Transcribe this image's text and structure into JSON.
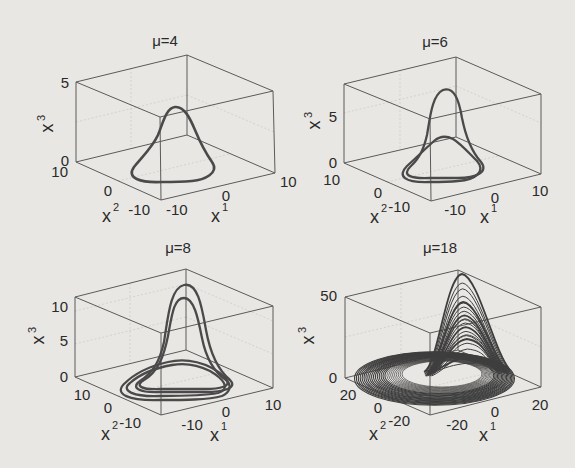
{
  "figure": {
    "background": "#e9e7e3",
    "line_color": "#4a4a4a",
    "box_color": "#5a5a5a"
  },
  "chart_data": [
    {
      "type": "line",
      "subtype": "3d-trajectory",
      "title": "μ=4",
      "xlabel": "x",
      "xlabel_sup": "1",
      "ylabel": "x",
      "ylabel_sup": "2",
      "zlabel": "x",
      "zlabel_sup": "3",
      "x_ticks": [
        "-10",
        "0",
        "10"
      ],
      "y_ticks": [
        "-10",
        "0",
        "10"
      ],
      "z_ticks": [
        "0",
        "5"
      ],
      "xlim": [
        -10,
        10
      ],
      "ylim": [
        -10,
        10
      ],
      "zlim": [
        0,
        5
      ],
      "description": "Single closed limit cycle; loop near x3≈0 rising to a peak of about x3≈3.5",
      "loops": 1,
      "peak_z": [
        3.5
      ]
    },
    {
      "type": "line",
      "subtype": "3d-trajectory",
      "title": "μ=6",
      "xlabel": "x",
      "xlabel_sup": "1",
      "ylabel": "x",
      "ylabel_sup": "2",
      "zlabel": "x",
      "zlabel_sup": "3",
      "x_ticks": [
        "-10",
        "0",
        "10"
      ],
      "y_ticks": [
        "-10",
        "0",
        "10"
      ],
      "z_ticks": [
        "0",
        "5"
      ],
      "xlim": [
        -10,
        10
      ],
      "ylim": [
        -10,
        10
      ],
      "zlim": [
        0,
        8
      ],
      "description": "Period-2 cycle: two loops, peaks at about x3≈7 and x3≈2.5",
      "loops": 2,
      "peak_z": [
        7,
        2.5
      ]
    },
    {
      "type": "line",
      "subtype": "3d-trajectory",
      "title": "μ=8",
      "xlabel": "x",
      "xlabel_sup": "1",
      "ylabel": "x",
      "ylabel_sup": "2",
      "zlabel": "x",
      "zlabel_sup": "3",
      "x_ticks": [
        "-10",
        "0",
        "10"
      ],
      "y_ticks": [
        "-10",
        "0",
        "10"
      ],
      "z_ticks": [
        "0",
        "5",
        "10"
      ],
      "xlim": [
        -12,
        12
      ],
      "ylim": [
        -12,
        12
      ],
      "zlim": [
        0,
        12
      ],
      "description": "Period-4 cycle: four loops, two tall peaks near x3≈13 and x3≈11, two low loops near x3≈2",
      "loops": 4,
      "peak_z": [
        13.5,
        11.5,
        2.2,
        1.5
      ]
    },
    {
      "type": "line",
      "subtype": "3d-trajectory",
      "title": "μ=18",
      "xlabel": "x",
      "xlabel_sup": "1",
      "ylabel": "x",
      "ylabel_sup": "2",
      "zlabel": "x",
      "zlabel_sup": "3",
      "x_ticks": [
        "-20",
        "0",
        "20"
      ],
      "y_ticks": [
        "-20",
        "0",
        "20"
      ],
      "z_ticks": [
        "0",
        "50"
      ],
      "xlim": [
        -25,
        25
      ],
      "ylim": [
        -25,
        25
      ],
      "zlim": [
        0,
        50
      ],
      "description": "Chaotic (Rössler-type) attractor: dense spiral band in x1-x2 plane with excursions up to x3≈60",
      "loops": 22,
      "peak_z": [
        60,
        55,
        52,
        48,
        45,
        42,
        40,
        38,
        36,
        34,
        32,
        30,
        28,
        26,
        24,
        22,
        20,
        18,
        15,
        12,
        8,
        5
      ]
    }
  ],
  "panels": [
    {
      "title": "μ=4",
      "x_ticks": [
        "-10",
        "0",
        "10"
      ],
      "y_ticks": [
        "-10",
        "0",
        "10"
      ],
      "z_ticks": [
        "0",
        "5"
      ]
    },
    {
      "title": "μ=6",
      "x_ticks": [
        "-10",
        "0",
        "10"
      ],
      "y_ticks": [
        "-10",
        "0",
        "10"
      ],
      "z_ticks": [
        "0",
        "5"
      ]
    },
    {
      "title": "μ=8",
      "x_ticks": [
        "-10",
        "0",
        "10"
      ],
      "y_ticks": [
        "-10",
        "0",
        "10"
      ],
      "z_ticks": [
        "0",
        "5",
        "10"
      ]
    },
    {
      "title": "μ=18",
      "x_ticks": [
        "-20",
        "0",
        "20"
      ],
      "y_ticks": [
        "-20",
        "0",
        "20"
      ],
      "z_ticks": [
        "0",
        "50"
      ]
    }
  ],
  "axis_labels": {
    "base": "x",
    "x_sup": "1",
    "y_sup": "2",
    "z_sup": "3"
  }
}
